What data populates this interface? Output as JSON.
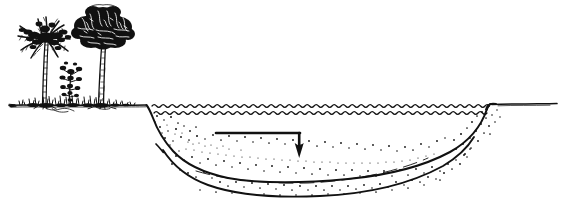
{
  "figure": {
    "kind": "line-drawing",
    "title": "Reservoir cross-section with sediment deposition",
    "medium": "pen-and-ink hand drawing",
    "background_color": "#ffffff",
    "ink_color": "#111111",
    "width_px": 563,
    "height_px": 209,
    "visible_text": "",
    "labels": []
  },
  "scene": {
    "ground": {
      "name": "ground-surface-line",
      "left_segment": {
        "x_start": 8,
        "x_end": 148,
        "y": 105
      },
      "right_segment": {
        "x_start": 487,
        "x_end": 556,
        "y": 104
      }
    },
    "vegetation": {
      "palm_tree": {
        "name": "palm-tree",
        "trunk_base_x": 42,
        "trunk_top_x": 44,
        "crown_center_x": 40,
        "crown_center_y": 30,
        "crown_radius": 22,
        "frond_count": 11,
        "height_px": 90
      },
      "broadleaf_tree": {
        "name": "broadleaf-tree",
        "trunk_base_x": 99,
        "trunk_top_x": 101,
        "crown_center_x": 101,
        "crown_center_y": 30,
        "crown_radius_x": 29,
        "crown_radius_y": 23,
        "height_px": 95
      },
      "shrub": {
        "name": "shrub",
        "base_x": 69,
        "base_y": 105,
        "height_px": 35
      },
      "grass_tufts": {
        "name": "grass-tufts",
        "x_start": 18,
        "x_end": 130,
        "count": 34
      }
    },
    "water": {
      "name": "water-surface",
      "wave_lines": 2,
      "wave_line_y": [
        106,
        113
      ],
      "x_start": 152,
      "x_end": 489,
      "wave_amplitude": 2,
      "wave_period": 9
    },
    "basin": {
      "name": "reservoir-basin",
      "left_bank_top_x": 148,
      "right_bank_top_x": 489,
      "deepest_y": 172,
      "upper_bed_curve": "M150,108 C160,130 190,158 250,168 C310,177 400,170 460,138 C478,128 486,116 489,107",
      "lower_bed_curve": "M163,150 C185,170 215,185 270,190 C330,195 420,180 470,148"
    },
    "sediment": {
      "name": "sediment-layer",
      "pattern": "stipple",
      "dot_count": 180,
      "band_description": "stippled band between upper and lower bed curves"
    },
    "arrow": {
      "name": "sediment-flow-arrow",
      "shape": "elbow-down",
      "horizontal_start_x": 216,
      "horizontal_end_x": 300,
      "horizontal_y": 133,
      "vertical_end_y": 157,
      "head_width": 9,
      "head_height": 11
    }
  }
}
